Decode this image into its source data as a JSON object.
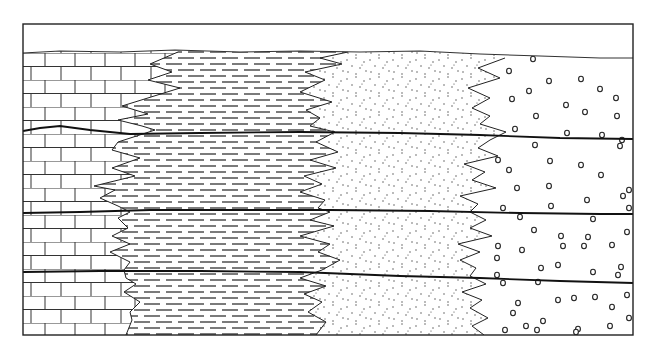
{
  "diagram": {
    "type": "stratigraphic-facies-cross-section",
    "frame": {
      "x": 23,
      "y": 24,
      "width": 610,
      "height": 311
    },
    "colors": {
      "line": "#222222",
      "background": "#ffffff"
    },
    "facies": [
      {
        "name": "limestone",
        "pattern": "brick",
        "position": "left"
      },
      {
        "name": "shale",
        "pattern": "dashes",
        "position": "center-left"
      },
      {
        "name": "sandstone",
        "pattern": "dots",
        "position": "center-right"
      },
      {
        "name": "conglomerate",
        "pattern": "pebbles",
        "position": "right"
      }
    ],
    "top_surface": [
      [
        23,
        53
      ],
      [
        60,
        51
      ],
      [
        120,
        52
      ],
      [
        175,
        50
      ],
      [
        240,
        52
      ],
      [
        300,
        51
      ],
      [
        360,
        52
      ],
      [
        420,
        51
      ],
      [
        480,
        54
      ],
      [
        540,
        56
      ],
      [
        600,
        58
      ],
      [
        633,
        58
      ]
    ],
    "bedding_planes": [
      [
        [
          23,
          131
        ],
        [
          40,
          128
        ],
        [
          60,
          126
        ],
        [
          90,
          130
        ],
        [
          130,
          134
        ],
        [
          200,
          133
        ],
        [
          300,
          132
        ],
        [
          400,
          133
        ],
        [
          480,
          135
        ],
        [
          560,
          138
        ],
        [
          633,
          139
        ]
      ],
      [
        [
          23,
          213
        ],
        [
          80,
          212
        ],
        [
          150,
          210
        ],
        [
          250,
          210
        ],
        [
          330,
          210
        ],
        [
          430,
          211
        ],
        [
          520,
          213
        ],
        [
          600,
          214
        ],
        [
          633,
          214
        ]
      ],
      [
        [
          23,
          272
        ],
        [
          100,
          271
        ],
        [
          200,
          271
        ],
        [
          300,
          272
        ],
        [
          400,
          276
        ],
        [
          480,
          278
        ],
        [
          560,
          281
        ],
        [
          633,
          283
        ]
      ]
    ],
    "contacts": {
      "limestone_shale": [
        [
          178,
          52
        ],
        [
          150,
          64
        ],
        [
          172,
          72
        ],
        [
          148,
          80
        ],
        [
          180,
          88
        ],
        [
          122,
          106
        ],
        [
          148,
          114
        ],
        [
          118,
          120
        ],
        [
          142,
          126
        ],
        [
          155,
          130
        ],
        [
          118,
          142
        ],
        [
          112,
          150
        ],
        [
          140,
          158
        ],
        [
          112,
          168
        ],
        [
          135,
          176
        ],
        [
          94,
          186
        ],
        [
          115,
          190
        ],
        [
          100,
          198
        ],
        [
          118,
          206
        ],
        [
          130,
          212
        ],
        [
          118,
          218
        ],
        [
          128,
          228
        ],
        [
          112,
          236
        ],
        [
          130,
          244
        ],
        [
          110,
          252
        ],
        [
          130,
          262
        ],
        [
          124,
          270
        ],
        [
          126,
          278
        ],
        [
          136,
          284
        ],
        [
          124,
          292
        ],
        [
          140,
          302
        ],
        [
          130,
          312
        ],
        [
          132,
          320
        ],
        [
          126,
          335
        ]
      ],
      "shale_sand": [
        [
          348,
          52
        ],
        [
          320,
          58
        ],
        [
          342,
          64
        ],
        [
          305,
          72
        ],
        [
          325,
          80
        ],
        [
          300,
          92
        ],
        [
          332,
          102
        ],
        [
          306,
          110
        ],
        [
          320,
          118
        ],
        [
          310,
          126
        ],
        [
          335,
          132
        ],
        [
          316,
          142
        ],
        [
          338,
          152
        ],
        [
          310,
          160
        ],
        [
          336,
          168
        ],
        [
          304,
          176
        ],
        [
          322,
          184
        ],
        [
          300,
          192
        ],
        [
          325,
          200
        ],
        [
          318,
          208
        ],
        [
          330,
          212
        ],
        [
          310,
          220
        ],
        [
          334,
          226
        ],
        [
          300,
          236
        ],
        [
          330,
          244
        ],
        [
          318,
          252
        ],
        [
          340,
          260
        ],
        [
          322,
          270
        ],
        [
          300,
          278
        ],
        [
          326,
          286
        ],
        [
          304,
          294
        ],
        [
          322,
          302
        ],
        [
          308,
          312
        ],
        [
          326,
          322
        ],
        [
          316,
          335
        ]
      ],
      "sand_conglomerate": [
        [
          505,
          58
        ],
        [
          478,
          68
        ],
        [
          500,
          78
        ],
        [
          468,
          88
        ],
        [
          490,
          98
        ],
        [
          472,
          108
        ],
        [
          490,
          116
        ],
        [
          480,
          124
        ],
        [
          506,
          132
        ],
        [
          490,
          140
        ],
        [
          478,
          148
        ],
        [
          498,
          156
        ],
        [
          464,
          164
        ],
        [
          485,
          172
        ],
        [
          472,
          180
        ],
        [
          496,
          188
        ],
        [
          460,
          196
        ],
        [
          478,
          204
        ],
        [
          470,
          212
        ],
        [
          486,
          220
        ],
        [
          470,
          228
        ],
        [
          492,
          236
        ],
        [
          458,
          244
        ],
        [
          480,
          252
        ],
        [
          460,
          260
        ],
        [
          476,
          268
        ],
        [
          470,
          276
        ],
        [
          486,
          284
        ],
        [
          462,
          292
        ],
        [
          482,
          300
        ],
        [
          470,
          308
        ],
        [
          488,
          318
        ],
        [
          472,
          326
        ],
        [
          484,
          335
        ]
      ]
    },
    "pebbles": [
      [
        533,
        59
      ],
      [
        509,
        71
      ],
      [
        549,
        81
      ],
      [
        581,
        79
      ],
      [
        529,
        91
      ],
      [
        512,
        99
      ],
      [
        566,
        105
      ],
      [
        600,
        89
      ],
      [
        616,
        98
      ],
      [
        536,
        116
      ],
      [
        585,
        112
      ],
      [
        617,
        116
      ],
      [
        515,
        129
      ],
      [
        567,
        133
      ],
      [
        602,
        135
      ],
      [
        535,
        145
      ],
      [
        622,
        140
      ],
      [
        498,
        160
      ],
      [
        509,
        170
      ],
      [
        550,
        161
      ],
      [
        517,
        188
      ],
      [
        549,
        186
      ],
      [
        581,
        165
      ],
      [
        620,
        146
      ],
      [
        601,
        175
      ],
      [
        623,
        196
      ],
      [
        503,
        208
      ],
      [
        551,
        206
      ],
      [
        587,
        200
      ],
      [
        629,
        190
      ],
      [
        520,
        217
      ],
      [
        593,
        219
      ],
      [
        629,
        208
      ],
      [
        534,
        230
      ],
      [
        563,
        246
      ],
      [
        627,
        232
      ],
      [
        561,
        236
      ],
      [
        588,
        237
      ],
      [
        498,
        246
      ],
      [
        522,
        250
      ],
      [
        612,
        245
      ],
      [
        497,
        258
      ],
      [
        584,
        246
      ],
      [
        558,
        265
      ],
      [
        541,
        268
      ],
      [
        621,
        267
      ],
      [
        618,
        275
      ],
      [
        503,
        283
      ],
      [
        538,
        282
      ],
      [
        593,
        272
      ],
      [
        574,
        298
      ],
      [
        497,
        275
      ],
      [
        518,
        303
      ],
      [
        595,
        297
      ],
      [
        513,
        313
      ],
      [
        627,
        295
      ],
      [
        558,
        300
      ],
      [
        543,
        321
      ],
      [
        612,
        307
      ],
      [
        578,
        329
      ],
      [
        493,
        344
      ],
      [
        526,
        326
      ],
      [
        629,
        318
      ],
      [
        610,
        326
      ],
      [
        576,
        332
      ],
      [
        537,
        330
      ],
      [
        505,
        330
      ]
    ]
  }
}
